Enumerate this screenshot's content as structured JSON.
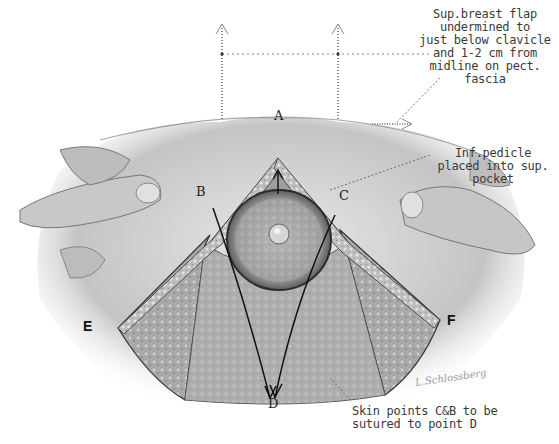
{
  "figure": {
    "annotations": {
      "superior_flap": [
        "Sup.breast flap",
        "undermined to",
        "just below clavicle",
        "and 1-2 cm from",
        "midline on pect.",
        "fascia"
      ],
      "inferior_pedicle": [
        "Inf.pedicle",
        "placed into sup.",
        "pocket"
      ],
      "skin_points": [
        "Skin points C&B to be",
        "sutured to point D"
      ]
    },
    "points": {
      "A": "A",
      "B": "B",
      "C": "C",
      "D": "D",
      "E": "E",
      "F": "F"
    },
    "signature": "L.Schlossberg",
    "colors": {
      "ink": "#222222",
      "tissue": "#8a8a8a",
      "skin": "#d6d6d6",
      "background": "#ffffff"
    }
  }
}
